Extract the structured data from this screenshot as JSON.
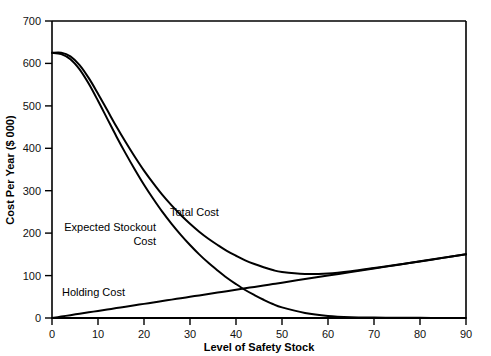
{
  "chart_data": {
    "type": "line",
    "title": "",
    "xlabel": "Level of Safety Stock",
    "ylabel": "Cost Per Year ($ 000)",
    "xlim": [
      0,
      90
    ],
    "ylim": [
      0,
      700
    ],
    "grid": false,
    "legend_position": "inline-annotations",
    "x_ticks": [
      "0",
      "10",
      "20",
      "30",
      "40",
      "50",
      "60",
      "70",
      "80",
      "90"
    ],
    "y_ticks": [
      "0",
      "100",
      "200",
      "300",
      "400",
      "500",
      "600",
      "700"
    ],
    "x_tick_values": [
      0,
      10,
      20,
      30,
      40,
      50,
      60,
      70,
      80,
      90
    ],
    "y_tick_values": [
      0,
      100,
      200,
      300,
      400,
      500,
      600,
      700
    ],
    "line_color": "#000000",
    "background_color": "#ffffff",
    "x": [
      0,
      2,
      4,
      6,
      8,
      10,
      12,
      14,
      16,
      18,
      20,
      22,
      24,
      26,
      28,
      30,
      32,
      34,
      36,
      38,
      40,
      42,
      44,
      46,
      48,
      50,
      55,
      60,
      65,
      70,
      75,
      80,
      85,
      90
    ],
    "series": [
      {
        "name": "Holding Cost",
        "label": "Holding Cost",
        "label_x": 6,
        "label_y": 55,
        "values": [
          0,
          3.3,
          6.7,
          10,
          13.3,
          16.7,
          20,
          23.3,
          26.7,
          30,
          33.3,
          36.7,
          40,
          43.3,
          46.7,
          50,
          53.3,
          56.7,
          60,
          63.3,
          66.7,
          70,
          73.3,
          76.7,
          80,
          83.3,
          91.7,
          100,
          108.3,
          116.7,
          125,
          133.3,
          141.7,
          150
        ]
      },
      {
        "name": "Expected Stockout Cost",
        "label": "Expected Stockout Cost",
        "label_line_1": "Expected Stockout",
        "label_line_2": "Cost",
        "label_x": 4,
        "label_y": 200,
        "values": [
          625,
          622,
          610,
          586,
          552,
          512,
          470,
          428,
          388,
          350,
          314,
          281,
          250,
          222,
          196,
          172,
          150,
          130,
          112,
          95,
          80,
          66,
          54,
          43,
          33,
          25,
          12,
          5,
          2,
          1,
          0.5,
          0.3,
          0.2,
          0
        ]
      },
      {
        "name": "Total Cost",
        "label": "Total Cost",
        "label_x": 28,
        "label_y": 255,
        "values": [
          625,
          625.3,
          616.7,
          596,
          565.3,
          528.7,
          490,
          451.3,
          414.7,
          380,
          347.3,
          317.7,
          290,
          265.3,
          242.7,
          222,
          203.3,
          186.7,
          172,
          158.3,
          146.7,
          136,
          127.3,
          119.7,
          113,
          108.3,
          103.7,
          105,
          110.3,
          117.7,
          125.5,
          133.6,
          141.9,
          150
        ]
      }
    ],
    "annotations": [
      {
        "text": "Total Cost",
        "x": 28,
        "y": 255
      },
      {
        "text": "Expected Stockout",
        "x": 4,
        "y": 212
      },
      {
        "text": "Cost",
        "x": 4,
        "y": 185
      },
      {
        "text": "Holding Cost",
        "x": 6,
        "y": 55
      }
    ]
  }
}
